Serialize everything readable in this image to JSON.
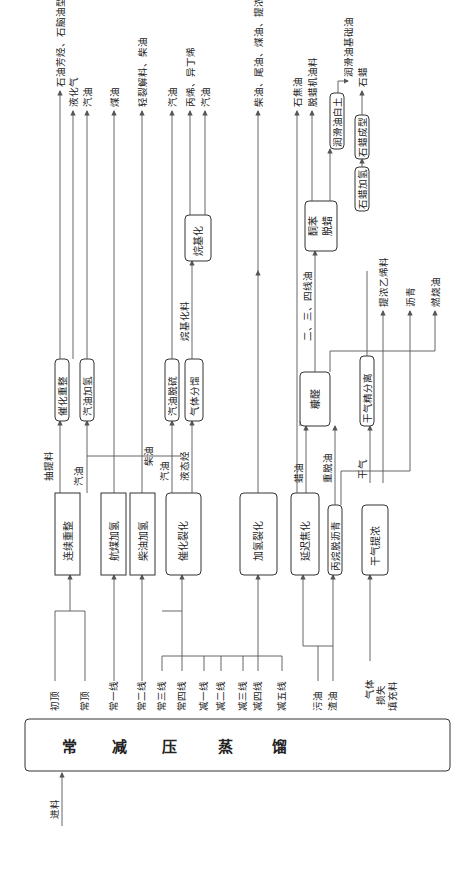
{
  "main": {
    "chars": [
      "常",
      "减",
      "压",
      "蒸",
      "馏"
    ],
    "feed": "进料"
  },
  "streams": {
    "chuding": "初顶",
    "changding": "常顶",
    "chang1": "常一线",
    "chang2": "常二线",
    "chang3": "常三线",
    "chang4": "常四线",
    "jian1": "减一线",
    "jian2": "减二线",
    "jian3": "减三线",
    "jian4": "减四线",
    "jian5": "减五线",
    "wuyou": "污油",
    "zhayou": "渣油",
    "qiti1": "气体",
    "qiti2": "损失",
    "qiti3": "填充料"
  },
  "units": {
    "lianxu": "连续重整",
    "hangmei": "航煤加氢",
    "chaiyou": "柴油加氢",
    "cuihua": "催化裂化",
    "jiaqing": "加氢裂化",
    "yanchi": "延迟焦化",
    "bingwan": "丙烷脱沥青",
    "ganqi": "干气提浓",
    "cuizheng": "催化重整",
    "qiyouJQ": "汽油加氢",
    "qiyouTL": "汽油脱硫",
    "qitifl": "气体分馏",
    "wanjihua": "烷基化",
    "kangquan": "糠醛",
    "ganqiF": "干气精分离",
    "tongben1": "酮苯",
    "tongben2": "脱蜡",
    "shilaJQ": "石蜡加氢",
    "shilaCX": "石蜡成型",
    "runhua": "润滑油白土"
  },
  "mids": {
    "chouti": "抽提料",
    "qiyou1": "汽油",
    "chaiyou": "柴油",
    "qiyou2": "汽油",
    "yetai": "液态烃",
    "wanji": "烷基化料",
    "layou": "蜡油",
    "zhongtuo": "重脱油",
    "ganqi": "干气",
    "ersansi": "二、三、四线油",
    "ersansi2": "二、三、四线油"
  },
  "products": {
    "fangting": "石油芳烃、石脑油型、碳六馏分",
    "yehua": "液化气",
    "qiyou_a": "汽油",
    "meiyou": "煤油",
    "qingliejie": "轻裂解料、柴油",
    "qiyou_b": "汽油",
    "bingxi": "丙烯、异丁烯",
    "qiyou_c": "汽油",
    "chaiweimei": "柴油、尾油、煤油、提浓乙烯料",
    "jiaotan": "石焦油",
    "tuolajiyou": "脱蜡机油料",
    "runhuajiyou": "润滑油基础油",
    "shila": "石蜡",
    "tinong": "提浓乙烯料",
    "liqing": "沥青",
    "ranliao": "燃烧油"
  }
}
